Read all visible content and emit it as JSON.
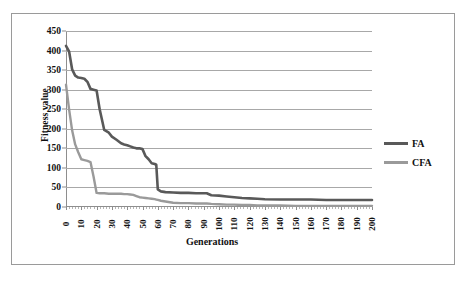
{
  "figure": {
    "background": "#ffffff",
    "border_color": "#9a9a9a"
  },
  "chart_data": {
    "type": "line",
    "title": "",
    "xlabel": "Generations",
    "ylabel": "Fitness value",
    "xlim": [
      0,
      200
    ],
    "ylim": [
      0,
      450
    ],
    "grid": true,
    "legend_position": "right",
    "y_ticks": [
      450,
      400,
      350,
      300,
      250,
      200,
      150,
      100,
      50,
      0
    ],
    "x_ticks": [
      0,
      10,
      20,
      30,
      40,
      50,
      60,
      70,
      80,
      90,
      100,
      110,
      120,
      130,
      140,
      150,
      160,
      170,
      180,
      190,
      200
    ],
    "x": [
      0,
      2,
      4,
      6,
      8,
      10,
      12,
      14,
      16,
      18,
      20,
      22,
      25,
      28,
      30,
      33,
      36,
      38,
      40,
      42,
      44,
      46,
      48,
      50,
      52,
      54,
      56,
      58,
      59,
      60,
      62,
      65,
      70,
      75,
      80,
      85,
      90,
      92,
      95,
      100,
      105,
      110,
      115,
      120,
      125,
      130,
      140,
      150,
      160,
      170,
      180,
      190,
      200
    ],
    "series": [
      {
        "name": "FA",
        "color": "#595959",
        "width": 2.6,
        "values": [
          412,
          398,
          352,
          336,
          331,
          330,
          328,
          320,
          302,
          300,
          298,
          250,
          197,
          190,
          180,
          172,
          163,
          160,
          158,
          155,
          152,
          150,
          150,
          148,
          130,
          122,
          112,
          110,
          108,
          45,
          40,
          38,
          37,
          36,
          36,
          35,
          35,
          35,
          30,
          29,
          27,
          25,
          23,
          22,
          21,
          20,
          19,
          19,
          19,
          18,
          18,
          18,
          18
        ]
      },
      {
        "name": "CFA",
        "color": "#9a9a9a",
        "width": 2.4,
        "values": [
          313,
          250,
          196,
          160,
          140,
          122,
          120,
          118,
          115,
          78,
          36,
          35,
          35,
          34,
          34,
          34,
          34,
          33,
          33,
          32,
          31,
          28,
          25,
          24,
          23,
          22,
          21,
          20,
          19,
          18,
          16,
          14,
          11,
          10,
          10,
          9,
          9,
          9,
          8,
          7,
          6,
          6,
          5,
          5,
          4,
          4,
          4,
          3,
          3,
          3,
          3,
          3,
          3
        ]
      }
    ]
  },
  "legend": {
    "items": [
      {
        "label": "FA",
        "color": "#595959"
      },
      {
        "label": "CFA",
        "color": "#9a9a9a"
      }
    ]
  }
}
